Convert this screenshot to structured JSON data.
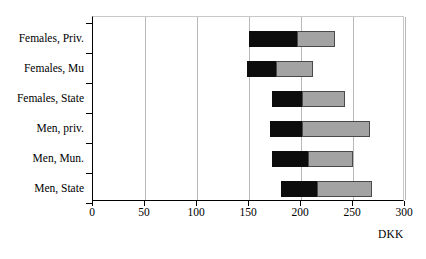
{
  "chart_data": {
    "type": "bar",
    "orientation": "horizontal",
    "stacked": true,
    "floating": true,
    "title": "",
    "xlabel": "DKK",
    "ylabel": "",
    "xlim": [
      0,
      300
    ],
    "xticks": [
      0,
      50,
      100,
      150,
      200,
      250,
      300
    ],
    "xtick_labels": [
      "0",
      "50",
      "100",
      "150",
      "200",
      "250",
      "300"
    ],
    "grid": true,
    "grid_axis": "x",
    "legend": "none",
    "categories": [
      "Females, Priv.",
      "Females, Mu",
      "Females, State",
      "Men, priv.",
      "Men, Mun.",
      "Men, State"
    ],
    "series": [
      {
        "name": "lower-segment",
        "color": "#0d0d0d",
        "starts": [
          150,
          148,
          172,
          170,
          172,
          181
        ],
        "ends": [
          196,
          176,
          201,
          201,
          207,
          215
        ]
      },
      {
        "name": "upper-segment",
        "color": "#a3a3a3",
        "starts": [
          196,
          176,
          201,
          201,
          207,
          215
        ],
        "ends": [
          233,
          212,
          242,
          266,
          250,
          268
        ]
      }
    ],
    "bars": [
      {
        "category": "Females, Priv.",
        "start": 150,
        "mid": 196,
        "end": 233
      },
      {
        "category": "Females, Mu",
        "start": 148,
        "mid": 176,
        "end": 212
      },
      {
        "category": "Females, State",
        "start": 172,
        "mid": 201,
        "end": 242
      },
      {
        "category": "Men, priv.",
        "start": 170,
        "mid": 201,
        "end": 266
      },
      {
        "category": "Men, Mun.",
        "start": 172,
        "mid": 207,
        "end": 250
      },
      {
        "category": "Men, State",
        "start": 181,
        "mid": 215,
        "end": 268
      }
    ],
    "colors": {
      "segment_low": "#0d0d0d",
      "segment_high": "#a3a3a3",
      "gridline": "#b8b8b8",
      "axis": "#000000",
      "background": "#ffffff"
    }
  }
}
